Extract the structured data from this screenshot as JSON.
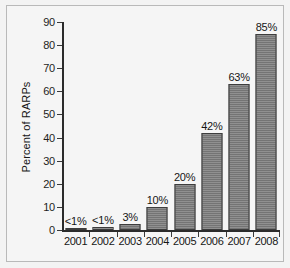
{
  "chart_data": {
    "type": "bar",
    "title": "",
    "xlabel": "",
    "ylabel": "Percent of RARPs",
    "categories": [
      "2001",
      "2002",
      "2003",
      "2004",
      "2005",
      "2006",
      "2007",
      "2008"
    ],
    "values": [
      0.7,
      1.1,
      2.5,
      10,
      20,
      42,
      63,
      85
    ],
    "data_labels": [
      "<1%",
      "<1%",
      "3%",
      "10%",
      "20%",
      "42%",
      "63%",
      "85%"
    ],
    "ylim": [
      0,
      90
    ],
    "yticks": [
      0,
      10,
      20,
      30,
      40,
      50,
      60,
      70,
      80,
      90
    ],
    "ytick_labels": [
      "0",
      "10",
      "20",
      "30",
      "40",
      "50",
      "60",
      "70",
      "80",
      "90"
    ],
    "grid": false,
    "legend": false,
    "legend_position": "none",
    "bar_color": "#7b7b7b",
    "bar_edge_color": "#3d3d3d",
    "axis_color": "#2b2b2b",
    "background_color": "#f5f5f5",
    "frame_color": "#b9b9b9"
  }
}
